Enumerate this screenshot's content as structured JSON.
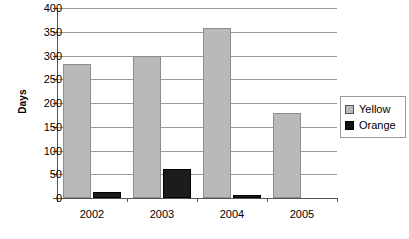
{
  "chart_data": {
    "type": "bar",
    "title": "",
    "xlabel": "",
    "ylabel": "Days",
    "categories": [
      "2002",
      "2003",
      "2004",
      "2005"
    ],
    "series": [
      {
        "name": "Yellow",
        "color": "#b9b9b9",
        "values": [
          282,
          299,
          358,
          180
        ]
      },
      {
        "name": "Orange",
        "color": "#1c1c1c",
        "values": [
          12,
          62,
          7,
          0
        ]
      }
    ],
    "ylim": [
      0,
      400
    ],
    "yticks": [
      0,
      50,
      100,
      150,
      200,
      250,
      300,
      350,
      400
    ],
    "ytick_labels": [
      "0",
      "50",
      "100",
      "150",
      "200",
      "250",
      "300",
      "350",
      "400"
    ],
    "grid": true,
    "legend_position": "right"
  },
  "legend": {
    "entries": [
      {
        "label": "Yellow",
        "swatch": "yellow-swatch"
      },
      {
        "label": "Orange",
        "swatch": "orange-swatch"
      }
    ]
  }
}
